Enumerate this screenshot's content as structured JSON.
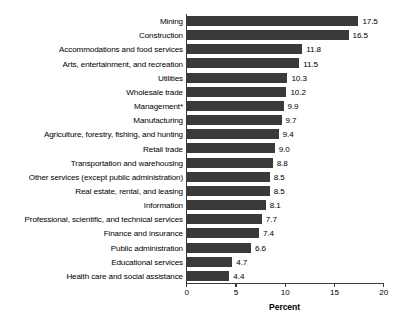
{
  "chart_data": {
    "type": "bar",
    "orientation": "horizontal",
    "title": "",
    "xlabel": "Percent",
    "ylabel": "",
    "xlim": [
      0,
      20
    ],
    "xticks": [
      "0",
      "5",
      "10",
      "15",
      "20"
    ],
    "grid": false,
    "legend": null,
    "bar_color": "#3a3a3a",
    "categories": [
      "Mining",
      "Construction",
      "Accommodations and food services",
      "Arts, entertainment, and recreation",
      "Utilities",
      "Wholesale trade",
      "Management*",
      "Manufacturing",
      "Agriculture, forestry, fishing, and hunting",
      "Retail trade",
      "Transportation and warehousing",
      "Other services (except public administration)",
      "Real estate, rental, and leasing",
      "Information",
      "Professional, scientific, and technical services",
      "Finance and insurance",
      "Public administration",
      "Educational services",
      "Health care and social assistance"
    ],
    "values": [
      17.5,
      16.5,
      11.8,
      11.5,
      10.3,
      10.2,
      9.9,
      9.7,
      9.4,
      9.0,
      8.8,
      8.5,
      8.5,
      8.1,
      7.7,
      7.4,
      6.6,
      4.7,
      4.4
    ],
    "value_labels": [
      "17.5",
      "16.5",
      "11.8",
      "11.5",
      "10.3",
      "10.2",
      "9.9",
      "9.7",
      "9.4",
      "9.0",
      "8.8",
      "8.5",
      "8.5",
      "8.1",
      "7.7",
      "7.4",
      "6.6",
      "4.7",
      "4.4"
    ]
  }
}
